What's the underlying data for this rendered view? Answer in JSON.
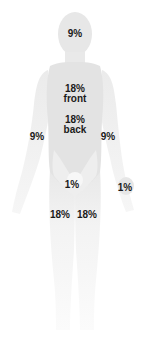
{
  "diagram": {
    "colors": {
      "background": "#ffffff",
      "body_fill": "#e6e6e6",
      "body_fill_light": "#f2f2f2",
      "leg_fade": "#f7f7f7",
      "text": "#1a1a1a"
    },
    "regions": [
      {
        "id": "head",
        "lines": [
          "9%"
        ],
        "x": 75,
        "y": 34
      },
      {
        "id": "torso-front",
        "lines": [
          "18%",
          "front"
        ],
        "x": 75,
        "y": 89
      },
      {
        "id": "torso-back",
        "lines": [
          "18%",
          "back"
        ],
        "x": 75,
        "y": 121
      },
      {
        "id": "left-arm",
        "lines": [
          "9%"
        ],
        "x": 37,
        "y": 131
      },
      {
        "id": "right-arm",
        "lines": [
          "9%"
        ],
        "x": 108,
        "y": 131
      },
      {
        "id": "groin",
        "lines": [
          "1%"
        ],
        "x": 75,
        "y": 180
      },
      {
        "id": "palm",
        "lines": [
          "1%"
        ],
        "x": 126,
        "y": 184
      },
      {
        "id": "left-leg",
        "lines": [
          "18%"
        ],
        "x": 60,
        "y": 210
      },
      {
        "id": "right-leg",
        "lines": [
          "18%"
        ],
        "x": 87,
        "y": 210
      }
    ]
  }
}
